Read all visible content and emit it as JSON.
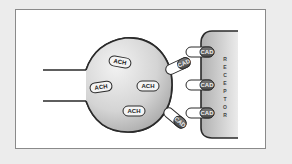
{
  "diagram": {
    "neuron": {
      "label_vesicles": [
        {
          "text": "ACH",
          "x": 120,
          "y": 62
        },
        {
          "text": "ACH",
          "x": 101,
          "y": 87
        },
        {
          "text": "ACH",
          "x": 148,
          "y": 86
        },
        {
          "text": "ACH",
          "x": 134,
          "y": 111
        }
      ]
    },
    "free_molecules": [
      {
        "text": "CAD",
        "x": 178,
        "y": 66,
        "angle": -25
      },
      {
        "text": "CAD",
        "x": 175,
        "y": 118,
        "angle": 40
      }
    ],
    "receptor": {
      "label": "RECEPTOR",
      "letters": [
        "R",
        "E",
        "C",
        "E",
        "P",
        "T",
        "O",
        "R"
      ],
      "bound_molecules": [
        {
          "text": "CAD",
          "y": 52
        },
        {
          "text": "CAD",
          "y": 85
        },
        {
          "text": "CAD",
          "y": 113
        }
      ]
    },
    "colors": {
      "background": "#ececec",
      "frame": "#ffffff",
      "stroke": "#2a2a2a",
      "fill_light": "#f0f0f0",
      "fill_dark": "#a8a8a8"
    }
  }
}
